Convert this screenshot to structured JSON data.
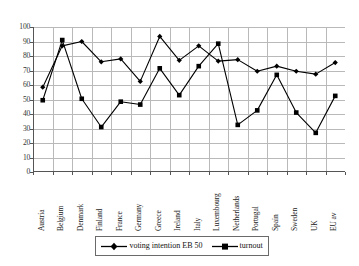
{
  "chart_data": {
    "type": "line",
    "title": "",
    "subtitle": "",
    "xlabel": "",
    "ylabel": "",
    "ylim": [
      0,
      100
    ],
    "ytick_step": 10,
    "grid": true,
    "legend_position": "bottom",
    "categories": [
      "Austria",
      "Belgium",
      "Denmark",
      "Finland",
      "France",
      "Germany",
      "Greece",
      "Ireland",
      "Italy",
      "Luxembourg",
      "Netherlands",
      "Portugal",
      "Spain",
      "Sweden",
      "UK",
      "EU av"
    ],
    "yticks": [
      "0",
      "10",
      "20",
      "30",
      "40",
      "50",
      "60",
      "70",
      "80",
      "90",
      "100"
    ],
    "series": [
      {
        "name": "voting intention EB 50",
        "marker": "diamond",
        "color": "#000000",
        "values": [
          58.5,
          87,
          90,
          76,
          78,
          62.5,
          93.5,
          77,
          87,
          76.5,
          77.5,
          69.5,
          73,
          69.5,
          67.5,
          75.5
        ]
      },
      {
        "name": "turnout",
        "marker": "square",
        "color": "#000000",
        "values": [
          49.5,
          91,
          50.5,
          31,
          48.5,
          46.5,
          71.5,
          53,
          73,
          88.5,
          32.5,
          42.5,
          67,
          41,
          27,
          52.5
        ]
      }
    ]
  },
  "legend": {
    "entries": [
      {
        "label": "voting intention EB 50",
        "marker": "diamond-marker-icon"
      },
      {
        "label": "turnout",
        "marker": "square-marker-icon"
      }
    ]
  },
  "colors": {
    "series": "#000000",
    "grid": "#b9b9b9",
    "axis": "#555555",
    "background": "#ffffff"
  }
}
